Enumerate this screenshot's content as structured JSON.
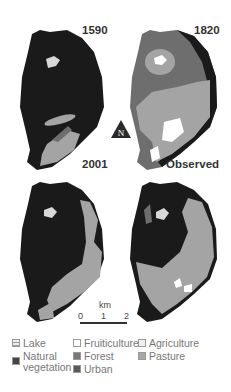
{
  "panels": [
    {
      "id": "1590",
      "title": "1590"
    },
    {
      "id": "1820",
      "title": "1820"
    },
    {
      "id": "2001",
      "title": "2001"
    },
    {
      "id": "observed",
      "title": "Observed"
    }
  ],
  "north_arrow": {
    "label": "N"
  },
  "scale_bar": {
    "unit": "km",
    "ticks": [
      "0",
      "1",
      "2"
    ]
  },
  "legend": {
    "items": [
      {
        "label": "Lake",
        "color": "#e8e8e8",
        "pattern": "hatched"
      },
      {
        "label": "Natural vegetation",
        "line1": "Natural",
        "line2": "vegetation",
        "color": "#444444"
      },
      {
        "label": "Fruiticulture",
        "color": "#ffffff"
      },
      {
        "label": "Forest",
        "color": "#777777"
      },
      {
        "label": "Urban",
        "color": "#5a5a5a"
      },
      {
        "label": "Agriculture",
        "color": "#f0f0f0"
      },
      {
        "label": "Pasture",
        "color": "#a8a8a8"
      }
    ]
  },
  "colors": {
    "natural_vegetation": "#1a1a1a",
    "forest": "#6e6e6e",
    "pasture": "#a4a4a4",
    "fruiticulture": "#ffffff",
    "lake": "#d8d8d8"
  }
}
